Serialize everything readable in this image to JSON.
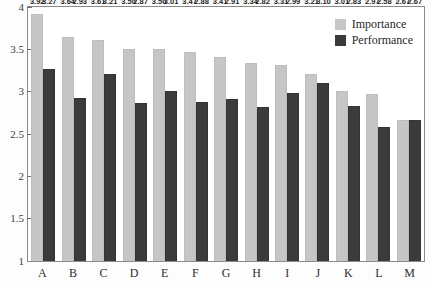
{
  "chart_data": {
    "type": "bar",
    "title": "",
    "subtitle": "",
    "xlabel": "",
    "ylabel": "",
    "ylim": [
      1,
      4
    ],
    "ytick_labels": [
      "1",
      "1.5",
      "2",
      "2.5",
      "3",
      "3.5",
      "4"
    ],
    "ytick_values": [
      1,
      1.5,
      2,
      2.5,
      3,
      3.5,
      4
    ],
    "grid": false,
    "legend_position": "top-right",
    "categories": [
      "A",
      "B",
      "C",
      "D",
      "E",
      "F",
      "G",
      "H",
      "I",
      "J",
      "K",
      "L",
      "M"
    ],
    "series": [
      {
        "name": "Importance",
        "color": "#c6c6c6",
        "values": [
          3.92,
          3.64,
          3.61,
          3.5,
          3.5,
          3.47,
          3.41,
          3.34,
          3.31,
          3.21,
          3.01,
          2.97,
          2.67
        ],
        "labels": [
          "3.92",
          "3.64",
          "3.61",
          "3.50",
          "3.50",
          "3.47",
          "3.41",
          "3.34",
          "3.31",
          "3.21",
          "3.01",
          "2.97",
          "2.67"
        ]
      },
      {
        "name": "Performance",
        "color": "#3b3b3b",
        "values": [
          3.27,
          2.93,
          3.21,
          2.87,
          3.01,
          2.88,
          2.91,
          2.82,
          2.99,
          3.1,
          2.83,
          2.58,
          2.67
        ],
        "labels": [
          "3.27",
          "2.93",
          "3.21",
          "2.87",
          "3.01",
          "2.88",
          "2.91",
          "2.82",
          "2.99",
          "3.10",
          "2.83",
          "2.58",
          "2.67"
        ]
      }
    ]
  },
  "legend": {
    "items": [
      {
        "label": "Importance",
        "swatch": "importance"
      },
      {
        "label": "Performance",
        "swatch": "performance"
      }
    ]
  }
}
